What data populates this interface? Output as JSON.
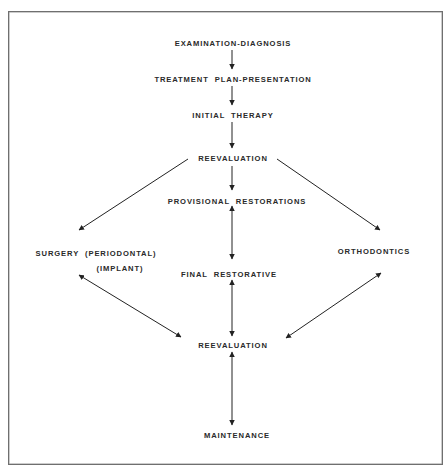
{
  "diagram": {
    "type": "flowchart",
    "colors": {
      "text": "#2a2a2a",
      "arrow": "#222222",
      "frame": "#6f6f6f",
      "background": "#ffffff"
    },
    "nodes": {
      "examination": {
        "label": "EXAMINATION-DIAGNOSIS",
        "x": 233,
        "y": 39
      },
      "treatment": {
        "label": "TREATMENT  PLAN-PRESENTATION",
        "x": 233,
        "y": 75
      },
      "initial": {
        "label": "INITIAL  THERAPY",
        "x": 233,
        "y": 111
      },
      "reevaluation_1": {
        "label": "REEVALUATION",
        "x": 233,
        "y": 154
      },
      "provisional": {
        "label": "PROVISIONAL  RESTORATIONS",
        "x": 237,
        "y": 197
      },
      "surgery": {
        "label": "SURGERY  (PERIODONTAL)",
        "x": 96,
        "y": 249
      },
      "implant": {
        "label": "(IMPLANT)",
        "x": 120,
        "y": 264
      },
      "orthodontics": {
        "label": "ORTHODONTICS",
        "x": 374,
        "y": 247
      },
      "final": {
        "label": "FINAL  RESTORATIVE",
        "x": 229,
        "y": 270
      },
      "reevaluation_2": {
        "label": "REEVALUATION",
        "x": 233,
        "y": 341
      },
      "maintenance": {
        "label": "MAINTENANCE",
        "x": 237,
        "y": 431
      }
    },
    "edges": [
      {
        "from": "examination",
        "to": "treatment",
        "x1": 232,
        "y1": 50,
        "x2": 232,
        "y2": 69,
        "type": "single"
      },
      {
        "from": "treatment",
        "to": "initial",
        "x1": 232,
        "y1": 86,
        "x2": 232,
        "y2": 105,
        "type": "single"
      },
      {
        "from": "initial",
        "to": "reevaluation_1",
        "x1": 232,
        "y1": 122,
        "x2": 232,
        "y2": 148,
        "type": "single"
      },
      {
        "from": "reevaluation_1",
        "to": "provisional",
        "x1": 232,
        "y1": 166,
        "x2": 232,
        "y2": 190,
        "type": "single"
      },
      {
        "from": "reevaluation_1",
        "to": "surgery",
        "x1": 188,
        "y1": 159,
        "x2": 79,
        "y2": 230,
        "type": "single"
      },
      {
        "from": "reevaluation_1",
        "to": "orthodontics",
        "x1": 277,
        "y1": 159,
        "x2": 380,
        "y2": 230,
        "type": "single"
      },
      {
        "from": "provisional",
        "to": "final",
        "x1": 232,
        "y1": 206,
        "x2": 232,
        "y2": 259,
        "type": "double"
      },
      {
        "from": "surgery",
        "to": "reevaluation_2",
        "x1": 79,
        "y1": 275,
        "x2": 181,
        "y2": 337,
        "type": "double"
      },
      {
        "from": "final",
        "to": "reevaluation_2",
        "x1": 232,
        "y1": 280,
        "x2": 232,
        "y2": 336,
        "type": "double"
      },
      {
        "from": "orthodontics",
        "to": "reevaluation_2",
        "x1": 381,
        "y1": 273,
        "x2": 286,
        "y2": 338,
        "type": "double"
      },
      {
        "from": "reevaluation_2",
        "to": "maintenance",
        "x1": 232,
        "y1": 352,
        "x2": 232,
        "y2": 425,
        "type": "double"
      }
    ]
  }
}
